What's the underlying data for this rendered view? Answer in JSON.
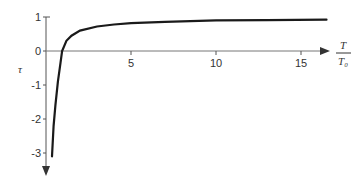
{
  "chart_data": {
    "type": "line",
    "title": "",
    "xlabel_numerator": "T",
    "xlabel_denominator": "T₀",
    "ylabel": "τ",
    "xlim": [
      0,
      17
    ],
    "ylim": [
      -3.3,
      1
    ],
    "x_ticks": [
      5,
      10,
      15
    ],
    "x_tick_labels": [
      "5",
      "10",
      "15"
    ],
    "y_ticks": [
      1,
      0,
      -1,
      -2,
      -3
    ],
    "y_tick_labels": [
      "1",
      "0",
      "-1",
      "-2",
      "-3"
    ],
    "grid": false,
    "legend": null,
    "series": [
      {
        "name": "tau",
        "color": "#1a1a1a",
        "x": [
          0.35,
          0.45,
          0.55,
          0.7,
          0.85,
          0.95,
          1.2,
          1.5,
          2,
          3,
          4,
          5,
          7,
          10,
          13,
          16.5
        ],
        "y": [
          -3.1,
          -2.2,
          -1.6,
          -0.9,
          -0.35,
          0.0,
          0.3,
          0.45,
          0.6,
          0.72,
          0.78,
          0.82,
          0.86,
          0.9,
          0.91,
          0.92
        ]
      }
    ]
  }
}
